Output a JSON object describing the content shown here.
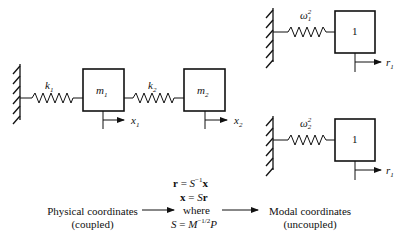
{
  "physical_system": {
    "springs": [
      {
        "label": "k",
        "subscript": "1"
      },
      {
        "label": "k",
        "subscript": "2"
      }
    ],
    "masses": [
      {
        "label": "m",
        "subscript": "1"
      },
      {
        "label": "m",
        "subscript": "2"
      }
    ],
    "displacements": [
      {
        "label": "x",
        "subscript": "1"
      },
      {
        "label": "x",
        "subscript": "2"
      }
    ]
  },
  "modal_systems": [
    {
      "spring": {
        "label": "ω",
        "superscript": "2",
        "subscript": "1"
      },
      "mass": {
        "label": "1"
      },
      "displacement": {
        "label": "r",
        "subscript": "1"
      }
    },
    {
      "spring": {
        "label": "ω",
        "superscript": "2",
        "subscript": "2"
      },
      "mass": {
        "label": "1"
      },
      "displacement": {
        "label": "r",
        "subscript": "1"
      }
    }
  ],
  "transformation": {
    "eq1": {
      "lhs": "r",
      "mid": " = ",
      "S": "S",
      "sup": "−1",
      "rhs": "x"
    },
    "eq2": {
      "lhs": "x",
      "mid": " = ",
      "S": "S",
      "rhs": "r"
    },
    "where": "where",
    "eq3": {
      "lhs": "S",
      "mid": " = ",
      "M": "M",
      "sup": "−1/2",
      "P": "P"
    }
  },
  "physical_coordinates": {
    "title": "Physical coordinates",
    "note": "(coupled)"
  },
  "modal_coordinates": {
    "title": "Modal coordinates",
    "note": "(uncoupled)"
  },
  "colors": {
    "stroke": "#111111",
    "background": "#ffffff"
  }
}
